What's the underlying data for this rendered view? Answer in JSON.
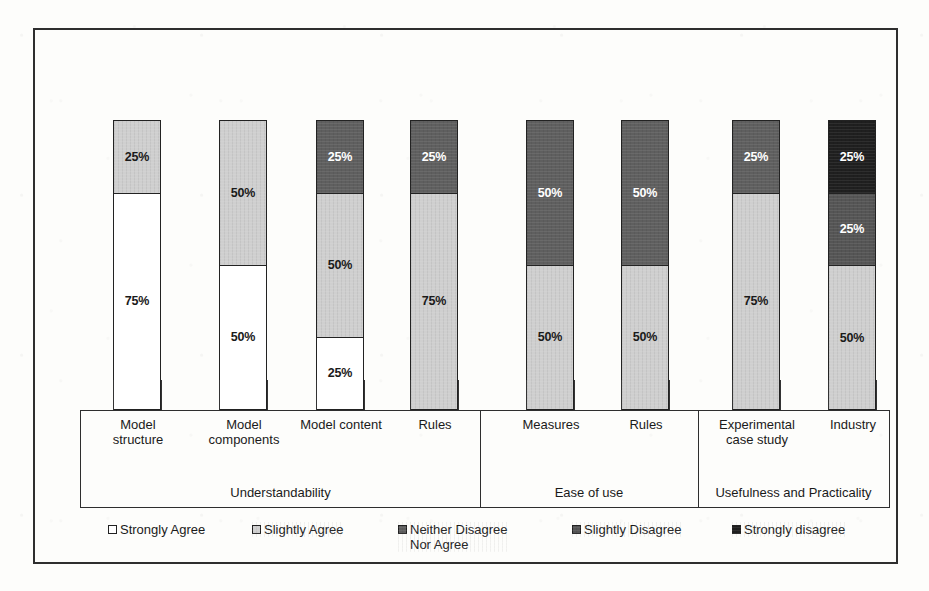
{
  "figure": {
    "background_color": "#fdfdfb",
    "frame_color": "#2e2e2e"
  },
  "chart_data": {
    "type": "bar",
    "subtype": "stacked-percentage",
    "title": "",
    "xlabel": "",
    "ylabel": "",
    "ylim": [
      0,
      100
    ],
    "grid": false,
    "legend_position": "bottom",
    "stack_order": "bottom-to-top",
    "categories": [
      "Model structure",
      "Model components",
      "Model content",
      "Rules",
      "Measures",
      "Rules",
      "Experimental case study",
      "Industry"
    ],
    "groups": [
      {
        "name": "Understandability",
        "categories": [
          "Model structure",
          "Model components",
          "Model content",
          "Rules"
        ]
      },
      {
        "name": "Ease of use",
        "categories": [
          "Measures",
          "Rules"
        ]
      },
      {
        "name": "Usefulness and Practicality",
        "categories": [
          "Experimental case study",
          "Industry"
        ]
      }
    ],
    "series": [
      {
        "name": "Strongly Agree",
        "color": "#ffffff",
        "values": [
          75,
          50,
          25,
          0,
          0,
          0,
          0,
          0
        ]
      },
      {
        "name": "Slightly Agree",
        "color": "#cfcfcf",
        "values": [
          25,
          50,
          50,
          75,
          50,
          50,
          75,
          50
        ]
      },
      {
        "name": "Neither Disagree Nor Agree",
        "color": "#5f5f5f",
        "values": [
          0,
          0,
          25,
          25,
          50,
          50,
          25,
          0
        ]
      },
      {
        "name": "Slightly Disagree",
        "color": "#555555",
        "values": [
          0,
          0,
          0,
          0,
          0,
          0,
          0,
          25
        ]
      },
      {
        "name": "Strongly disagree",
        "color": "#1f1f1f",
        "values": [
          0,
          0,
          0,
          0,
          0,
          0,
          0,
          25
        ]
      }
    ],
    "bars": [
      {
        "category": "Model structure",
        "group": "Understandability",
        "segments": [
          {
            "series": "Strongly Agree",
            "value": 75,
            "label": "75%",
            "swatch": "strongly-agree",
            "label_pos": "mid"
          },
          {
            "series": "Slightly Agree",
            "value": 25,
            "label": "25%",
            "swatch": "slightly-agree",
            "label_pos": "mid"
          }
        ]
      },
      {
        "category": "Model components",
        "group": "Understandability",
        "segments": [
          {
            "series": "Strongly Agree",
            "value": 50,
            "label": "50%",
            "swatch": "strongly-agree",
            "label_pos": "mid"
          },
          {
            "series": "Slightly Agree",
            "value": 50,
            "label": "50%",
            "swatch": "slightly-agree",
            "label_pos": "mid"
          }
        ]
      },
      {
        "category": "Model content",
        "group": "Understandability",
        "segments": [
          {
            "series": "Strongly Agree",
            "value": 25,
            "label": "25%",
            "swatch": "strongly-agree",
            "label_pos": "mid"
          },
          {
            "series": "Slightly Agree",
            "value": 50,
            "label": "50%",
            "swatch": "slightly-agree",
            "label_pos": "mid"
          },
          {
            "series": "Neither Disagree Nor Agree",
            "value": 25,
            "label": "25%",
            "swatch": "neither",
            "label_pos": "mid"
          }
        ]
      },
      {
        "category": "Rules",
        "group": "Understandability",
        "segments": [
          {
            "series": "Slightly Agree",
            "value": 75,
            "label": "75%",
            "swatch": "slightly-agree",
            "label_pos": "mid"
          },
          {
            "series": "Neither Disagree Nor Agree",
            "value": 25,
            "label": "25%",
            "swatch": "neither",
            "label_pos": "mid"
          }
        ]
      },
      {
        "category": "Measures",
        "group": "Ease of use",
        "segments": [
          {
            "series": "Slightly Agree",
            "value": 50,
            "label": "50%",
            "swatch": "slightly-agree",
            "label_pos": "mid"
          },
          {
            "series": "Neither Disagree Nor Agree",
            "value": 50,
            "label": "50%",
            "swatch": "neither",
            "label_pos": "mid"
          }
        ]
      },
      {
        "category": "Rules",
        "group": "Ease of use",
        "segments": [
          {
            "series": "Slightly Agree",
            "value": 50,
            "label": "50%",
            "swatch": "slightly-agree",
            "label_pos": "mid"
          },
          {
            "series": "Neither Disagree Nor Agree",
            "value": 50,
            "label": "50%",
            "swatch": "neither",
            "label_pos": "mid"
          }
        ]
      },
      {
        "category": "Experimental case study",
        "group": "Usefulness and Practicality",
        "segments": [
          {
            "series": "Slightly Agree",
            "value": 75,
            "label": "75%",
            "swatch": "slightly-agree",
            "label_pos": "mid"
          },
          {
            "series": "Neither Disagree Nor Agree",
            "value": 25,
            "label": "25%",
            "swatch": "neither",
            "label_pos": "mid"
          }
        ]
      },
      {
        "category": "Industry",
        "group": "Usefulness and Practicality",
        "segments": [
          {
            "series": "Slightly Agree",
            "value": 50,
            "label": "50%",
            "swatch": "slightly-agree",
            "label_pos": "mid"
          },
          {
            "series": "Slightly Disagree",
            "value": 25,
            "label": "25%",
            "swatch": "slightly-disagree",
            "label_pos": "mid"
          },
          {
            "series": "Strongly disagree",
            "value": 25,
            "label": "25%",
            "swatch": "strongly-disagree",
            "label_pos": "mid"
          }
        ]
      }
    ],
    "legend": [
      {
        "label": "Strongly Agree",
        "swatch": "strongly-agree",
        "color": "#ffffff"
      },
      {
        "label": "Slightly Agree",
        "swatch": "slightly-agree",
        "color": "#cfcfcf"
      },
      {
        "label": "Neither Disagree\nNor Agree",
        "swatch": "neither",
        "color": "#5f5f5f"
      },
      {
        "label": "Slightly Disagree",
        "swatch": "slightly-disagree",
        "color": "#555555"
      },
      {
        "label": "Strongly disagree",
        "swatch": "strongly-disagree",
        "color": "#1f1f1f"
      }
    ]
  },
  "axis_labels": {
    "categories": [
      {
        "line1": "Model",
        "line2": "structure"
      },
      {
        "line1": "Model",
        "line2": "components"
      },
      {
        "line1": "Model content",
        "line2": ""
      },
      {
        "line1": "Rules",
        "line2": ""
      },
      {
        "line1": "Measures",
        "line2": ""
      },
      {
        "line1": "Rules",
        "line2": ""
      },
      {
        "line1": "Experimental",
        "line2": "case study"
      },
      {
        "line1": "Industry",
        "line2": ""
      }
    ],
    "groups": [
      {
        "name": "Understandability"
      },
      {
        "name": "Ease of use"
      },
      {
        "name": "Usefulness and Practicality"
      }
    ]
  }
}
